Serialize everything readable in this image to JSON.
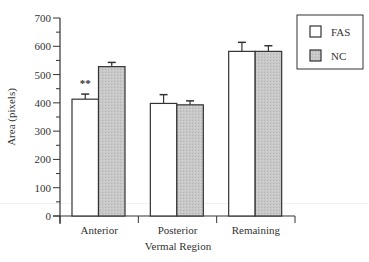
{
  "chart_data": {
    "type": "bar",
    "title": "",
    "xlabel": "Vermal Region",
    "ylabel": "Area (pixels)",
    "ylim": [
      0,
      700
    ],
    "yticks": [
      0,
      100,
      200,
      300,
      400,
      500,
      600,
      700
    ],
    "y_minor_step": 50,
    "grid": false,
    "legend_position": "upper right",
    "categories": [
      "Anterior",
      "Posterior",
      "Remaining"
    ],
    "series": [
      {
        "name": "FAS",
        "fill": "#ffffff",
        "values": [
          413,
          398,
          582
        ],
        "errors": [
          18,
          31,
          32
        ]
      },
      {
        "name": "NC",
        "fill": "#c8c8c8",
        "values": [
          528,
          393,
          582
        ],
        "errors": [
          15,
          14,
          20
        ]
      }
    ],
    "annotations": [
      {
        "text": "**",
        "category": "Anterior",
        "series": "FAS",
        "y": 470
      }
    ]
  }
}
